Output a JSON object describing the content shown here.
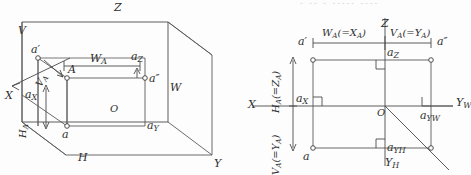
{
  "figure": {
    "type": "descriptive-geometry-projection",
    "panels": [
      "pictorial-projection-box",
      "unfolded-orthographic-projection"
    ],
    "top_cut_text": "- -- - ----- ----"
  },
  "left_panel": {
    "name": "pictorial-projection-box",
    "planes": {
      "vertical": "V",
      "horizontal": "H",
      "profile": "W"
    },
    "axes": {
      "x": "X",
      "y": "Y",
      "z": "Z"
    },
    "origin": "O",
    "points": {
      "space_point": "A",
      "front_view": "a′",
      "top_view": "a",
      "side_view": "a″",
      "on_x": "a",
      "on_x_sub": "X",
      "on_y": "a",
      "on_y_sub": "Y",
      "on_z": "a",
      "on_z_sub": "Z"
    },
    "dimensions": {
      "width": "W",
      "width_sub": "A",
      "depth": "V",
      "depth_sub": "A",
      "height": "H",
      "height_sub": "A"
    }
  },
  "right_panel": {
    "name": "unfolded-orthographic-projection",
    "axes": {
      "x": "X",
      "z": "Z",
      "y_w": "Y",
      "y_w_sub": "W",
      "y_h": "Y",
      "y_h_sub": "H"
    },
    "origin": "O",
    "points": {
      "front_view": "a′",
      "top_view": "a",
      "side_view": "a″",
      "on_x": "a",
      "on_x_sub": "X",
      "on_z": "a",
      "on_z_sub": "Z",
      "on_yw": "a",
      "on_yw_sub": "YW",
      "on_yh": "a",
      "on_yh_sub": "YH"
    },
    "dimensions": {
      "width": "W",
      "width_sub": "A",
      "width_eq": "(=X",
      "width_eq_sub": "A",
      "width_eq_close": ")",
      "depth_top": "V",
      "depth_top_sub": "A",
      "depth_top_eq": "(=Y",
      "depth_top_eq_sub": "A",
      "depth_top_eq_close": ")",
      "height": "H",
      "height_sub": "A",
      "height_eq": "(=Z",
      "height_eq_sub": "A",
      "height_eq_close": ")",
      "depth_left": "V",
      "depth_left_sub": "A",
      "depth_left_eq": "(=Y",
      "depth_left_eq_sub": "A",
      "depth_left_eq_close": ")"
    }
  },
  "colors": {
    "line": "#5a5a5a",
    "line_dark": "#3c3c3c",
    "text": "#2e2e2e",
    "background": "#fdfdfd"
  }
}
